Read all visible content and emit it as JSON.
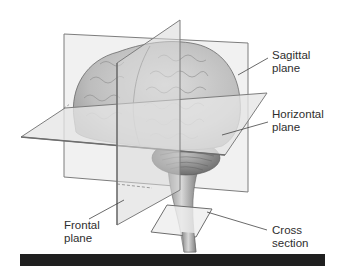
{
  "figure": {
    "labels": {
      "sagittal": {
        "line1": "Sagittal",
        "line2": "plane"
      },
      "horizontal": {
        "line1": "Horizontal",
        "line2": "plane"
      },
      "frontal": {
        "line1": "Frontal",
        "line2": "plane"
      },
      "cross": {
        "line1": "Cross",
        "line2": "section"
      }
    }
  },
  "colors": {
    "plane_fill": "#e9e9e9",
    "plane_edge": "#8a8a8a",
    "brain_fill": "#c8c8c8",
    "brain_dark": "#9a9a9a",
    "text": "#2e2e2e",
    "bar": "#1f1f1f"
  }
}
